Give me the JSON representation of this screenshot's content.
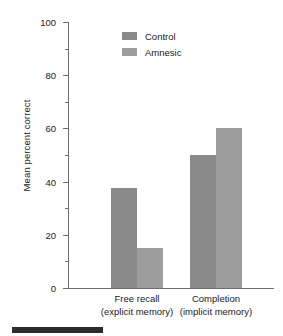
{
  "chart_data": {
    "type": "bar",
    "title": "",
    "xlabel": "",
    "ylabel": "Mean percent correct",
    "ylim": [
      0,
      100
    ],
    "yticks": [
      0,
      20,
      40,
      60,
      80,
      100
    ],
    "ytick_labels": [
      "0",
      "20",
      "40",
      "60",
      "80",
      "100"
    ],
    "minor_yticks": [
      10,
      30,
      50,
      70,
      90
    ],
    "grid": false,
    "legend_position": "upper center",
    "categories": [
      "Free recall (explicit memory)",
      "Completion (implicit memory)"
    ],
    "category_lines": [
      [
        "Free recall",
        "(explicit memory)"
      ],
      [
        "Completion",
        "(implicit memory)"
      ]
    ],
    "series": [
      {
        "name": "Control",
        "color": "#8a8a8a",
        "values": [
          37.5,
          50
        ]
      },
      {
        "name": "Amnesic",
        "color": "#9d9d9d",
        "values": [
          15,
          60
        ]
      }
    ]
  },
  "legend": {
    "items": [
      {
        "label": "Control",
        "color": "#8a8a8a"
      },
      {
        "label": "Amnesic",
        "color": "#9d9d9d"
      }
    ]
  },
  "axis": {
    "y_title": "Mean percent correct",
    "tick_labels": [
      "100",
      "80",
      "60",
      "40",
      "20",
      "0"
    ],
    "axis_color": "#6d6d6d"
  },
  "xlabels": [
    {
      "line1": "Free recall",
      "line2": "(explicit memory)"
    },
    {
      "line1": "Completion",
      "line2": "(implicit memory)"
    }
  ],
  "caption_rule": {
    "color": "#2c2c2c"
  }
}
